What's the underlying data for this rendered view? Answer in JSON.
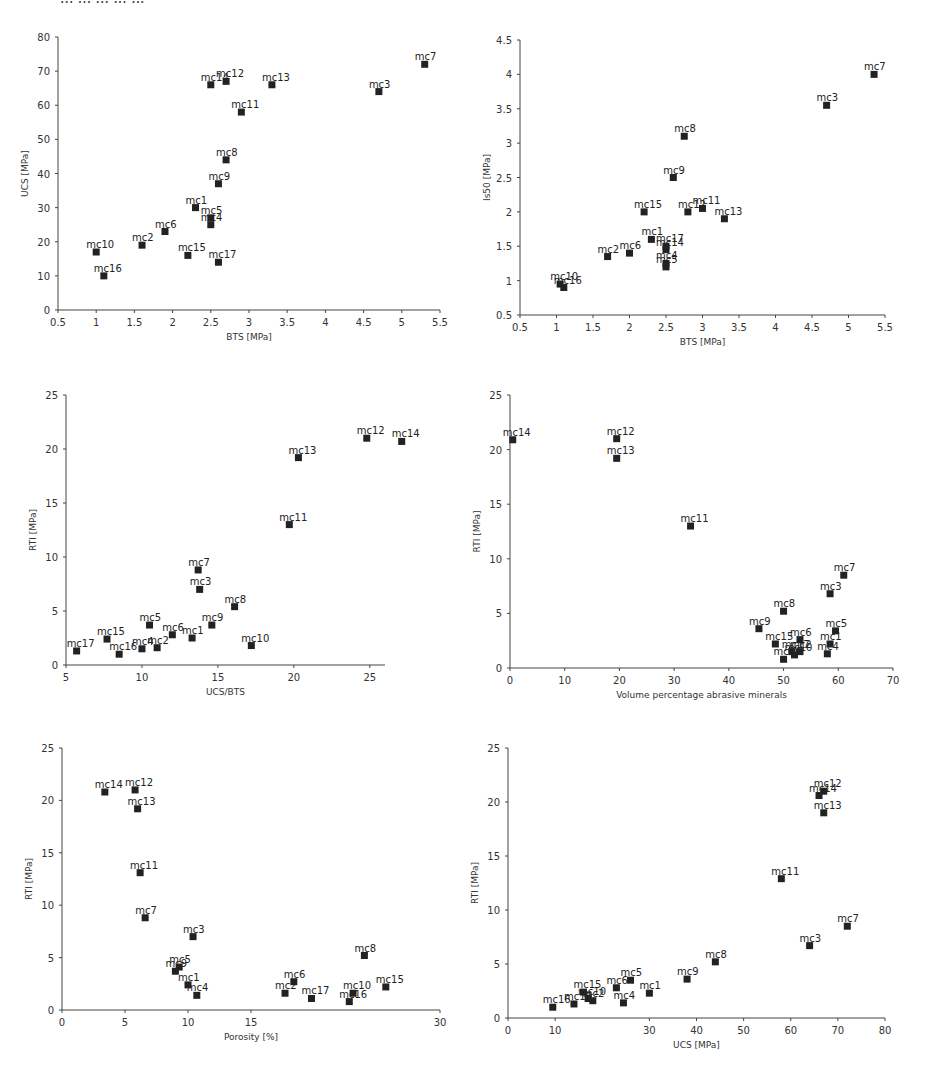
{
  "figure": {
    "caption_partial": "... ... ... ... ..."
  },
  "chart_data": [
    {
      "id": "ucs-vs-bts",
      "type": "scatter",
      "title": "",
      "xlabel": "BTS [MPa]",
      "ylabel": "UCS [MPa]",
      "xlim": [
        0.5,
        5.5
      ],
      "ylim": [
        0,
        80
      ],
      "xticks": [
        "0.5",
        "1",
        "1.5",
        "2",
        "2.5",
        "3",
        "3.5",
        "4",
        "4.5",
        "5",
        "5.5"
      ],
      "yticks": [
        "0",
        "10",
        "20",
        "30",
        "40",
        "50",
        "60",
        "70",
        "80"
      ],
      "grid": false,
      "points": [
        {
          "label": "mc1",
          "x": 2.3,
          "y": 30
        },
        {
          "label": "mc2",
          "x": 1.6,
          "y": 19
        },
        {
          "label": "mc3",
          "x": 4.7,
          "y": 64
        },
        {
          "label": "mc4",
          "x": 2.5,
          "y": 25
        },
        {
          "label": "mc5",
          "x": 2.5,
          "y": 27
        },
        {
          "label": "mc6",
          "x": 1.9,
          "y": 23
        },
        {
          "label": "mc7",
          "x": 5.3,
          "y": 72
        },
        {
          "label": "mc8",
          "x": 2.7,
          "y": 44
        },
        {
          "label": "mc9",
          "x": 2.6,
          "y": 37
        },
        {
          "label": "mc10",
          "x": 1.0,
          "y": 17
        },
        {
          "label": "mc11",
          "x": 2.9,
          "y": 58
        },
        {
          "label": "mc12",
          "x": 2.7,
          "y": 67
        },
        {
          "label": "mc13",
          "x": 3.3,
          "y": 66
        },
        {
          "label": "mc14",
          "x": 2.5,
          "y": 66
        },
        {
          "label": "mc15",
          "x": 2.2,
          "y": 16
        },
        {
          "label": "mc16",
          "x": 1.1,
          "y": 10
        },
        {
          "label": "mc17",
          "x": 2.6,
          "y": 14
        }
      ]
    },
    {
      "id": "is50-vs-bts",
      "type": "scatter",
      "title": "",
      "xlabel": "BTS [MPa]",
      "ylabel": "Is50 [MPa]",
      "xlim": [
        0.5,
        5.5
      ],
      "ylim": [
        0.5,
        4.5
      ],
      "xticks": [
        "0.5",
        "1",
        "1.5",
        "2",
        "2.5",
        "3",
        "3.5",
        "4",
        "4.5",
        "5",
        "5.5"
      ],
      "yticks": [
        "0.5",
        "1",
        "1.5",
        "2",
        "2.5",
        "3",
        "3.5",
        "4",
        "4.5"
      ],
      "grid": false,
      "points": [
        {
          "label": "mc1",
          "x": 2.3,
          "y": 1.6
        },
        {
          "label": "mc2",
          "x": 1.7,
          "y": 1.35
        },
        {
          "label": "mc3",
          "x": 4.7,
          "y": 3.55
        },
        {
          "label": "mc4",
          "x": 2.5,
          "y": 1.25
        },
        {
          "label": "mc5",
          "x": 2.5,
          "y": 1.2
        },
        {
          "label": "mc6",
          "x": 2.0,
          "y": 1.4
        },
        {
          "label": "mc7",
          "x": 5.35,
          "y": 4.0
        },
        {
          "label": "mc8",
          "x": 2.75,
          "y": 3.1
        },
        {
          "label": "mc9",
          "x": 2.6,
          "y": 2.5
        },
        {
          "label": "mc10",
          "x": 1.05,
          "y": 0.95
        },
        {
          "label": "mc11",
          "x": 3.0,
          "y": 2.05
        },
        {
          "label": "mc12",
          "x": 2.8,
          "y": 2.0
        },
        {
          "label": "mc13",
          "x": 3.3,
          "y": 1.9
        },
        {
          "label": "mc14",
          "x": 2.5,
          "y": 1.45
        },
        {
          "label": "mc15",
          "x": 2.2,
          "y": 2.0
        },
        {
          "label": "mc16",
          "x": 1.1,
          "y": 0.9
        },
        {
          "label": "mc17",
          "x": 2.5,
          "y": 1.5
        }
      ]
    },
    {
      "id": "rti-vs-ucs-bts",
      "type": "scatter",
      "title": "",
      "xlabel": "UCS/BTS",
      "ylabel": "RTI [MPa]",
      "xlim": [
        5,
        26
      ],
      "ylim": [
        0,
        25
      ],
      "xticks": [
        "5",
        "10",
        "15",
        "20",
        "25"
      ],
      "yticks": [
        "0",
        "5",
        "10",
        "15",
        "20",
        "25"
      ],
      "grid": false,
      "points": [
        {
          "label": "mc1",
          "x": 13.3,
          "y": 2.5
        },
        {
          "label": "mc2",
          "x": 11.0,
          "y": 1.6
        },
        {
          "label": "mc3",
          "x": 13.8,
          "y": 7.0
        },
        {
          "label": "mc4",
          "x": 10.0,
          "y": 1.5
        },
        {
          "label": "mc5",
          "x": 10.5,
          "y": 3.7
        },
        {
          "label": "mc6",
          "x": 12.0,
          "y": 2.8
        },
        {
          "label": "mc7",
          "x": 13.7,
          "y": 8.8
        },
        {
          "label": "mc8",
          "x": 16.1,
          "y": 5.4
        },
        {
          "label": "mc9",
          "x": 14.6,
          "y": 3.7
        },
        {
          "label": "mc10",
          "x": 17.2,
          "y": 1.8
        },
        {
          "label": "mc11",
          "x": 19.7,
          "y": 13.0
        },
        {
          "label": "mc12",
          "x": 24.8,
          "y": 21.0
        },
        {
          "label": "mc13",
          "x": 20.3,
          "y": 19.2
        },
        {
          "label": "mc14",
          "x": 27.1,
          "y": 20.7
        },
        {
          "label": "mc15",
          "x": 7.7,
          "y": 2.4
        },
        {
          "label": "mc16",
          "x": 8.5,
          "y": 1.0
        },
        {
          "label": "mc17",
          "x": 5.7,
          "y": 1.3
        }
      ]
    },
    {
      "id": "rti-vs-abrasive",
      "type": "scatter",
      "title": "",
      "xlabel": "Volume percentage abrasive minerals",
      "ylabel": "RTI [MPa]",
      "xlim": [
        0,
        70
      ],
      "ylim": [
        0,
        25
      ],
      "xticks": [
        "0",
        "10",
        "20",
        "30",
        "40",
        "50",
        "60",
        "70"
      ],
      "yticks": [
        "0",
        "5",
        "10",
        "15",
        "20",
        "25"
      ],
      "grid": false,
      "points": [
        {
          "label": "mc1",
          "x": 58.5,
          "y": 2.2
        },
        {
          "label": "mc2",
          "x": 53,
          "y": 1.5
        },
        {
          "label": "mc3",
          "x": 58.5,
          "y": 6.8
        },
        {
          "label": "mc4",
          "x": 58,
          "y": 1.3
        },
        {
          "label": "mc5",
          "x": 59.5,
          "y": 3.4
        },
        {
          "label": "mc6",
          "x": 53,
          "y": 2.6
        },
        {
          "label": "mc7",
          "x": 61,
          "y": 8.5
        },
        {
          "label": "mc8",
          "x": 50,
          "y": 5.2
        },
        {
          "label": "mc9",
          "x": 45.5,
          "y": 3.6
        },
        {
          "label": "mc10",
          "x": 52,
          "y": 1.2
        },
        {
          "label": "mc11",
          "x": 33,
          "y": 13.0
        },
        {
          "label": "mc12",
          "x": 19.5,
          "y": 21.0
        },
        {
          "label": "mc13",
          "x": 19.5,
          "y": 19.2
        },
        {
          "label": "mc14",
          "x": 0.5,
          "y": 20.9
        },
        {
          "label": "mc15",
          "x": 48.5,
          "y": 2.2
        },
        {
          "label": "mc16",
          "x": 50,
          "y": 0.8
        },
        {
          "label": "mc17",
          "x": 51.5,
          "y": 1.5
        }
      ]
    },
    {
      "id": "rti-vs-porosity",
      "type": "scatter",
      "title": "",
      "xlabel": "Porosity [%]",
      "ylabel": "RTI [MPa]",
      "xlim": [
        0,
        30
      ],
      "ylim": [
        0,
        25
      ],
      "xticks": [
        "0",
        "5",
        "10",
        "15",
        "30"
      ],
      "yticks": [
        "0",
        "5",
        "10",
        "15",
        "20",
        "25"
      ],
      "grid": false,
      "points": [
        {
          "label": "mc1",
          "x": 10.0,
          "y": 2.4
        },
        {
          "label": "mc2",
          "x": 17.7,
          "y": 1.6
        },
        {
          "label": "mc3",
          "x": 10.4,
          "y": 7.0
        },
        {
          "label": "mc4",
          "x": 10.7,
          "y": 1.4
        },
        {
          "label": "mc5",
          "x": 9.3,
          "y": 4.1
        },
        {
          "label": "mc6",
          "x": 18.4,
          "y": 2.7
        },
        {
          "label": "mc7",
          "x": 6.6,
          "y": 8.8
        },
        {
          "label": "mc8",
          "x": 24.0,
          "y": 5.2
        },
        {
          "label": "mc9",
          "x": 9.0,
          "y": 3.7
        },
        {
          "label": "mc10",
          "x": 23.1,
          "y": 1.6
        },
        {
          "label": "mc11",
          "x": 6.2,
          "y": 13.1
        },
        {
          "label": "mc12",
          "x": 5.8,
          "y": 21.0
        },
        {
          "label": "mc13",
          "x": 6.0,
          "y": 19.2
        },
        {
          "label": "mc14",
          "x": 3.4,
          "y": 20.8
        },
        {
          "label": "mc15",
          "x": 25.7,
          "y": 2.2
        },
        {
          "label": "mc16",
          "x": 22.8,
          "y": 0.8
        },
        {
          "label": "mc17",
          "x": 19.8,
          "y": 1.1
        }
      ]
    },
    {
      "id": "rti-vs-ucs",
      "type": "scatter",
      "title": "",
      "xlabel": "UCS [MPa]",
      "ylabel": "RTI [MPa]",
      "xlim": [
        0,
        80
      ],
      "ylim": [
        0,
        25
      ],
      "xticks": [
        "0",
        "10",
        "30",
        "40",
        "50",
        "60",
        "70",
        "80"
      ],
      "yticks": [
        "0",
        "5",
        "10",
        "15",
        "20",
        "25"
      ],
      "grid": false,
      "points": [
        {
          "label": "mc1",
          "x": 30,
          "y": 2.3
        },
        {
          "label": "mc2",
          "x": 18,
          "y": 1.6
        },
        {
          "label": "mc3",
          "x": 64,
          "y": 6.7
        },
        {
          "label": "mc4",
          "x": 24.5,
          "y": 1.4
        },
        {
          "label": "mc5",
          "x": 26,
          "y": 3.5
        },
        {
          "label": "mc6",
          "x": 23,
          "y": 2.8
        },
        {
          "label": "mc7",
          "x": 72,
          "y": 8.5
        },
        {
          "label": "mc8",
          "x": 44,
          "y": 5.2
        },
        {
          "label": "mc9",
          "x": 38,
          "y": 3.6
        },
        {
          "label": "mc10",
          "x": 17,
          "y": 1.8
        },
        {
          "label": "mc11",
          "x": 58,
          "y": 12.9
        },
        {
          "label": "mc12",
          "x": 67,
          "y": 21.0
        },
        {
          "label": "mc13",
          "x": 67,
          "y": 19.0
        },
        {
          "label": "mc14",
          "x": 66,
          "y": 20.6
        },
        {
          "label": "mc15",
          "x": 16,
          "y": 2.4
        },
        {
          "label": "mc16",
          "x": 9.5,
          "y": 1.0
        },
        {
          "label": "mc17",
          "x": 14,
          "y": 1.3
        }
      ]
    }
  ]
}
